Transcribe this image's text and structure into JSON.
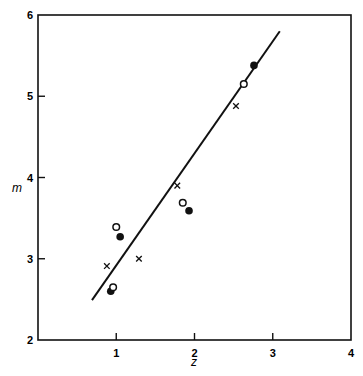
{
  "chart_data": {
    "type": "scatter",
    "title": "",
    "xlabel": "z",
    "ylabel": "m",
    "xlim": [
      0,
      4
    ],
    "ylim": [
      2,
      6
    ],
    "xticks": [
      1,
      2,
      3,
      4
    ],
    "yticks": [
      2,
      3,
      4,
      5,
      6
    ],
    "grid": false,
    "legend": null,
    "series": [
      {
        "name": "filled circles",
        "marker": "filled-circle",
        "points": [
          {
            "x": 0.93,
            "y": 2.6
          },
          {
            "x": 1.05,
            "y": 3.27
          },
          {
            "x": 1.93,
            "y": 3.59
          },
          {
            "x": 2.76,
            "y": 5.38
          }
        ]
      },
      {
        "name": "open circles",
        "marker": "open-circle",
        "points": [
          {
            "x": 0.96,
            "y": 2.65
          },
          {
            "x": 1.0,
            "y": 3.39
          },
          {
            "x": 1.85,
            "y": 3.69
          },
          {
            "x": 2.63,
            "y": 5.15
          }
        ]
      },
      {
        "name": "crosses",
        "marker": "x",
        "points": [
          {
            "x": 0.88,
            "y": 2.91
          },
          {
            "x": 1.29,
            "y": 3.0
          },
          {
            "x": 1.78,
            "y": 3.9
          },
          {
            "x": 2.53,
            "y": 4.88
          }
        ]
      }
    ],
    "fit_line": {
      "name": "regression line",
      "x": [
        0.69,
        3.09
      ],
      "y": [
        2.49,
        5.8
      ]
    }
  },
  "axes": {
    "x_label": "z",
    "y_label": "m",
    "x_tick_labels": [
      "1",
      "2",
      "3",
      "4"
    ],
    "y_tick_labels": [
      "2",
      "3",
      "4",
      "5",
      "6"
    ]
  },
  "colors": {
    "ink": "#111111",
    "background": "#ffffff"
  }
}
